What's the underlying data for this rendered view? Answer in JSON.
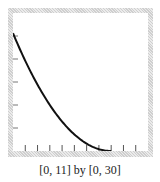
{
  "chart_data": {
    "type": "line",
    "title": "",
    "caption": "[0, 11] by [0, 30]",
    "xlabel": "",
    "ylabel": "",
    "xlim": [
      0,
      11
    ],
    "ylim": [
      0,
      30
    ],
    "x_ticks": [
      1,
      2,
      3,
      4,
      5,
      6,
      7,
      8,
      9,
      10
    ],
    "y_ticks": [
      5,
      10,
      15,
      20,
      25
    ],
    "grid": false,
    "legend": null,
    "series": [
      {
        "name": "curve",
        "color": "#111111",
        "x": [
          0,
          1,
          2,
          3,
          4,
          5,
          6,
          7,
          8
        ],
        "y": [
          25.6,
          19.6,
          14.4,
          10.0,
          6.4,
          3.6,
          1.6,
          0.4,
          0.0
        ]
      }
    ]
  },
  "frame": {
    "border_color": "#d8d8d8",
    "plot_bg": "#ffffff"
  }
}
